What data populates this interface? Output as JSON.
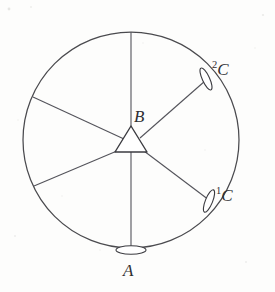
{
  "figure": {
    "background_color": "#fdfdfc",
    "line_color": "#4a4a4e",
    "label_color": "#2f2f33"
  },
  "circle": {
    "center_x": 131,
    "center_y": 140,
    "radius": 108,
    "name": "horizon-circle"
  },
  "station": {
    "symbol": "triangle",
    "label": "B",
    "center_x": 131,
    "center_y": 143
  },
  "targets": [
    {
      "id": "A",
      "label": "A",
      "superscript": "",
      "symbol": "flat-ellipse",
      "angle_deg": 270,
      "marker_x": 131,
      "marker_y": 250,
      "label_x": 123,
      "label_y": 262
    },
    {
      "id": "C1",
      "label": "C",
      "superscript": "1",
      "symbol": "lens-ellipse",
      "angle_deg": -35,
      "marker_x": 209,
      "marker_y": 201,
      "label_x": 216,
      "label_y": 186
    },
    {
      "id": "C2",
      "label": "C",
      "superscript": "2",
      "symbol": "lens-ellipse",
      "angle_deg": 35,
      "marker_x": 206,
      "marker_y": 79,
      "label_x": 212,
      "label_y": 60
    }
  ],
  "rays": [
    {
      "name": "ray-up",
      "angle_deg": 90
    },
    {
      "name": "ray-upper-left",
      "angle_deg": 155
    },
    {
      "name": "ray-lower-left",
      "angle_deg": 205
    },
    {
      "name": "ray-upper-right",
      "angle_deg": 35
    },
    {
      "name": "ray-lower-right",
      "angle_deg": -35
    },
    {
      "name": "ray-down",
      "angle_deg": 270
    }
  ],
  "labels": {
    "b": "B",
    "a": "A",
    "c1_sup": "1",
    "c1_base": "C",
    "c2_sup": "2",
    "c2_base": "C"
  }
}
